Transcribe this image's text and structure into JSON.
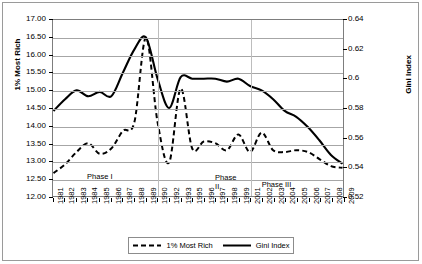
{
  "chart_data": {
    "type": "line",
    "title": "",
    "xlabel": "",
    "ylabel": "1% Most Rich",
    "y2label": "Gini Index",
    "grid": true,
    "legend_position": "bottom",
    "ylim": [
      12.0,
      17.0
    ],
    "y2lim": [
      0.52,
      0.64
    ],
    "yticks": [
      "12.00",
      "12.50",
      "13.00",
      "13.50",
      "14.00",
      "14.50",
      "15.00",
      "15.50",
      "16.00",
      "16.50",
      "17.00"
    ],
    "y2ticks": [
      "0.52",
      "0.54",
      "0.56",
      "0.58",
      "0.6",
      "0.62",
      "0.64"
    ],
    "categories": [
      "1981",
      "1982",
      "1983",
      "1984",
      "1985",
      "1986",
      "1987",
      "1988",
      "1989",
      "1990",
      "1992",
      "1993",
      "1995",
      "1996",
      "1997",
      "1998",
      "1999",
      "2001",
      "2002",
      "2003",
      "2004",
      "2005",
      "2006",
      "2007",
      "2008",
      "2009"
    ],
    "series": [
      {
        "name": "1% Most Rich",
        "axis": "left",
        "style": "dashed",
        "color": "#000000",
        "values": [
          12.65,
          12.9,
          13.25,
          13.5,
          13.2,
          13.35,
          13.85,
          14.1,
          16.5,
          14.1,
          12.95,
          15.05,
          13.35,
          13.55,
          13.5,
          13.3,
          13.75,
          13.25,
          13.8,
          13.3,
          13.25,
          13.3,
          13.25,
          13.05,
          12.85,
          12.8
        ]
      },
      {
        "name": "Gini Index",
        "axis": "right",
        "style": "solid",
        "color": "#000000",
        "values": [
          0.578,
          0.586,
          0.592,
          0.588,
          0.591,
          0.588,
          0.604,
          0.62,
          0.628,
          0.6,
          0.58,
          0.601,
          0.6,
          0.6,
          0.6,
          0.598,
          0.6,
          0.595,
          0.592,
          0.586,
          0.578,
          0.574,
          0.567,
          0.558,
          0.548,
          0.542
        ]
      }
    ],
    "annotations": [
      {
        "text": "Phase I",
        "category": "1985"
      },
      {
        "text": "Phase II",
        "category": "1998"
      },
      {
        "text": "Phase III",
        "category": "2003"
      }
    ],
    "dividers": [
      "1990",
      "2001"
    ]
  },
  "legend": {
    "items": [
      {
        "label": "1% Most Rich",
        "style": "dashed"
      },
      {
        "label": "Gini Index",
        "style": "solid"
      }
    ]
  }
}
